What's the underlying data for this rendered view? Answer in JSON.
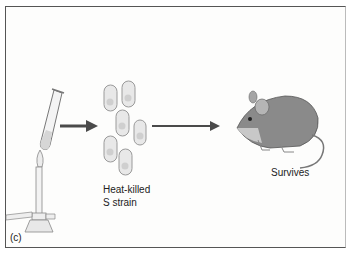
{
  "panel_label": "(c)",
  "steps": [
    {
      "name": "heating",
      "description": "Test tube heated over Bunsen burner flame"
    },
    {
      "name": "bacteria",
      "label_line1": "Heat-killed",
      "label_line2": "S strain",
      "cell_count": 6
    },
    {
      "name": "mouse",
      "label": "Survives"
    }
  ],
  "colors": {
    "arrow": "#4a4a4a",
    "frame": "#555555",
    "cell_fill": "#e6e6e6",
    "cell_stroke": "#999999",
    "mouse": "#7a7a7a"
  }
}
